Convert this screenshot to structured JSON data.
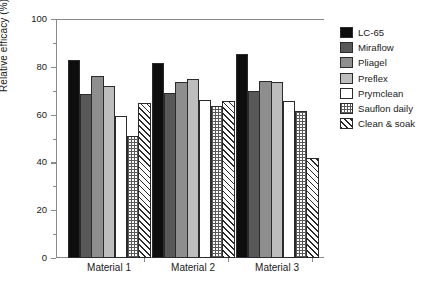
{
  "chart_data": {
    "type": "bar",
    "title": "",
    "xlabel": "",
    "ylabel": "Relative efficacy (%)",
    "ylim": [
      0,
      100
    ],
    "yticks": [
      0,
      20,
      40,
      60,
      80,
      100
    ],
    "ytick_labels": [
      "0",
      "20",
      "40",
      "60",
      "80",
      "100"
    ],
    "minor_ticks": [
      10,
      30,
      50,
      70,
      90
    ],
    "grid": false,
    "legend_position": "right",
    "categories": [
      "Material 1",
      "Material 2",
      "Material 3"
    ],
    "series": [
      {
        "name": "LC-65",
        "color": "#0d0d0d",
        "pattern": "solid",
        "values": [
          83.0,
          81.5,
          85.5
        ]
      },
      {
        "name": "Miraflow",
        "color": "#585858",
        "pattern": "solid",
        "values": [
          68.5,
          69.0,
          70.0
        ]
      },
      {
        "name": "Pliagel",
        "color": "#8e8e8e",
        "pattern": "solid",
        "values": [
          76.0,
          73.5,
          74.0
        ]
      },
      {
        "name": "Preflex",
        "color": "#bdbdbd",
        "pattern": "solid",
        "values": [
          72.0,
          75.0,
          73.5
        ]
      },
      {
        "name": "Prymclean",
        "color": "#ffffff",
        "pattern": "solid",
        "values": [
          59.5,
          66.0,
          65.5
        ]
      },
      {
        "name": "Sauflon daily",
        "color": "#ffffff",
        "pattern": "dotted-grid",
        "values": [
          51.0,
          63.5,
          61.5
        ]
      },
      {
        "name": "Clean & soak",
        "color": "#ffffff",
        "pattern": "diagonal",
        "values": [
          65.0,
          65.5,
          42.0
        ]
      }
    ]
  },
  "legend": {
    "items": [
      {
        "label": "LC-65"
      },
      {
        "label": "Miraflow"
      },
      {
        "label": "Pliagel"
      },
      {
        "label": "Preflex"
      },
      {
        "label": "Prymclean"
      },
      {
        "label": "Sauflon daily"
      },
      {
        "label": "Clean & soak"
      }
    ]
  }
}
